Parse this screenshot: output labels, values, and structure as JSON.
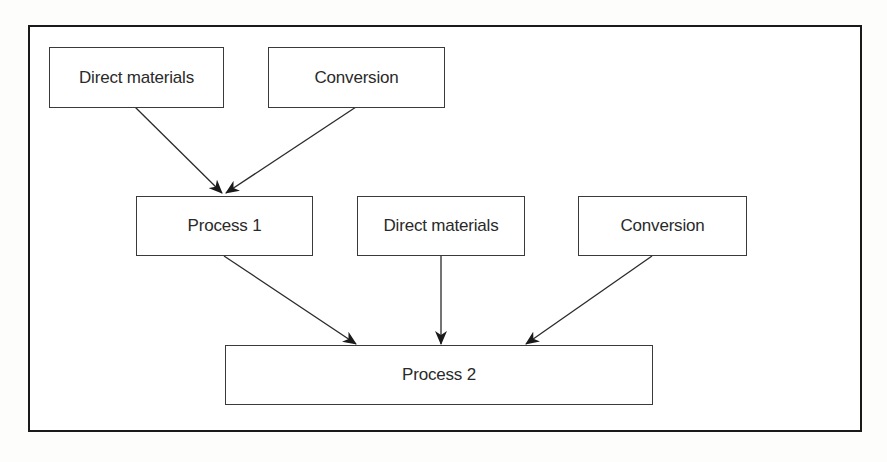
{
  "diagram": {
    "type": "flowchart",
    "nodes": [
      {
        "id": "dm1",
        "label": "Direct materials"
      },
      {
        "id": "conv1",
        "label": "Conversion"
      },
      {
        "id": "p1",
        "label": "Process 1"
      },
      {
        "id": "dm2",
        "label": "Direct materials"
      },
      {
        "id": "conv2",
        "label": "Conversion"
      },
      {
        "id": "p2",
        "label": "Process 2"
      }
    ],
    "edges": [
      {
        "from": "dm1",
        "to": "p1"
      },
      {
        "from": "conv1",
        "to": "p1"
      },
      {
        "from": "p1",
        "to": "p2"
      },
      {
        "from": "dm2",
        "to": "p2"
      },
      {
        "from": "conv2",
        "to": "p2"
      }
    ],
    "colors": {
      "line": "#2a2a2a",
      "frame": "#1a1a1a",
      "background": "#ffffff"
    }
  }
}
